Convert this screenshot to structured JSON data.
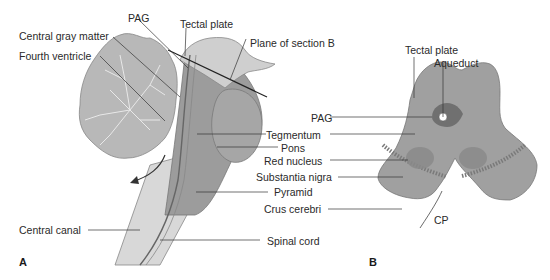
{
  "panel_a": {
    "letter": "A",
    "labels": {
      "pag": "PAG",
      "tectal_plate": "Tectal plate",
      "central_gray_matter": "Central gray matter",
      "fourth_ventricle": "Fourth ventricle",
      "plane_of_section": "Plane of section B",
      "tegmentum": "Tegmentum",
      "pons": "Pons",
      "pyramid": "Pyramid",
      "central_canal": "Central canal",
      "spinal_cord": "Spinal cord"
    }
  },
  "panel_b": {
    "letter": "B",
    "labels": {
      "tectal_plate": "Tectal plate",
      "aqueduct": "Aqueduct",
      "pag": "PAG",
      "tegmentum": "Tegmentum",
      "red_nucleus": "Red nucleus",
      "substantia_nigra": "Substantia nigra",
      "crus_cerebri": "Crus cerebri",
      "cp": "CP"
    }
  },
  "colors": {
    "brainstem": "#9a9a9a",
    "brainstem_dark": "#8a8a8a",
    "cerebellum": "#b5b5b5",
    "cord": "#d6d6d6",
    "leader": "#333333",
    "section": "#a3a3a3",
    "nucleus": "#8e8e8e"
  }
}
